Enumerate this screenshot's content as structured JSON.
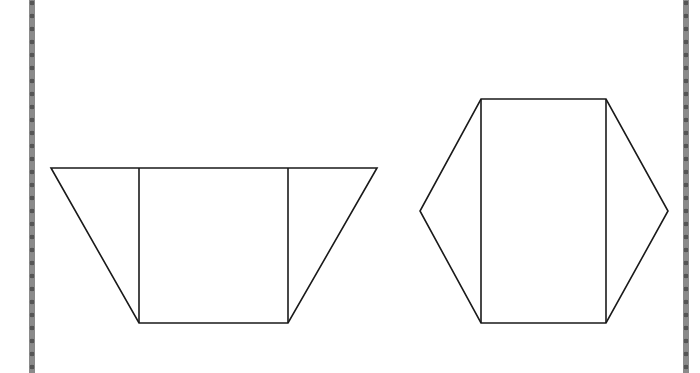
{
  "page": {
    "borders": {
      "color": "#8a8a8a",
      "dot_color": "#555555",
      "left_x": 32,
      "right_x": 686
    }
  },
  "diagram": {
    "stroke_color": "#1a1a1a",
    "shapes": [
      {
        "name": "trapezoid",
        "outline": [
          [
            51,
            168
          ],
          [
            377,
            168
          ],
          [
            288,
            323
          ],
          [
            139,
            323
          ]
        ],
        "inner_lines": [
          [
            [
              139,
              168
            ],
            [
              139,
              323
            ]
          ],
          [
            [
              288,
              168
            ],
            [
              288,
              323
            ]
          ]
        ]
      },
      {
        "name": "hexagon",
        "outline": [
          [
            481,
            99
          ],
          [
            606,
            99
          ],
          [
            668,
            211
          ],
          [
            606,
            323
          ],
          [
            481,
            323
          ],
          [
            420,
            211
          ]
        ],
        "inner_lines": [
          [
            [
              481,
              99
            ],
            [
              481,
              323
            ]
          ],
          [
            [
              606,
              99
            ],
            [
              606,
              323
            ]
          ]
        ]
      }
    ]
  }
}
